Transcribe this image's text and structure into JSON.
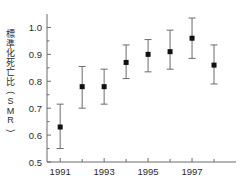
{
  "chart_data": {
    "type": "scatter",
    "title": "",
    "xlabel": "",
    "ylabel": "標準化死亡比(SMR)",
    "ylim": [
      0.5,
      1.05
    ],
    "xlim": [
      1990.4,
      1999.0
    ],
    "grid": false,
    "legend": null,
    "y_ticks": [
      "0.5",
      "0.6",
      "0.7",
      "0.8",
      "0.9",
      "1.0"
    ],
    "y_tick_values": [
      0.5,
      0.6,
      0.7,
      0.8,
      0.9,
      1.0
    ],
    "x_ticks": [
      "1991",
      "1993",
      "1995",
      "1997"
    ],
    "x_tick_values": [
      1991,
      1993,
      1995,
      1997
    ],
    "x_minor_tick_values": [
      1992,
      1994,
      1996,
      1998
    ],
    "categories": [
      1991,
      1992,
      1993,
      1994,
      1995,
      1996,
      1997,
      1998
    ],
    "values": [
      0.63,
      0.78,
      0.78,
      0.87,
      0.9,
      0.91,
      0.96,
      0.86
    ],
    "error_low": [
      0.55,
      0.7,
      0.715,
      0.81,
      0.835,
      0.845,
      0.885,
      0.79
    ],
    "error_high": [
      0.715,
      0.855,
      0.845,
      0.935,
      0.955,
      0.99,
      1.035,
      0.935
    ],
    "marker": "square",
    "marker_color": "#111111",
    "errorbar_color": "#6b6b6b",
    "axis_color": "#6b6b6b"
  },
  "ylabel_chars": [
    "標",
    "準",
    "化",
    "死",
    "亡",
    "比",
    "(",
    "S",
    "M",
    "R",
    ")"
  ]
}
